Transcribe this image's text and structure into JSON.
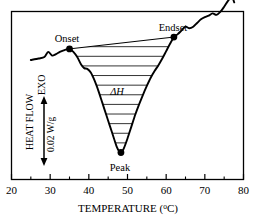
{
  "chart_data": {
    "type": "line",
    "title": "",
    "xlabel": "TEMPERATURE (°C)",
    "ylabel": "HEAT FLOW",
    "y_scale_bar": "0.02 W/g",
    "y_direction_label": "EXO",
    "xlim": [
      20,
      80
    ],
    "grid": false,
    "legend": "none",
    "xticks": [
      20,
      30,
      40,
      50,
      60,
      70,
      80
    ],
    "xtick_labels": [
      "20",
      "30",
      "40",
      "50",
      "60",
      "70",
      "80"
    ],
    "xminor_ticks": [
      25,
      35,
      45,
      55,
      65,
      75
    ],
    "yticks_labeled": false,
    "series": [
      {
        "name": "DSC heat flow trace",
        "x": [
          25.0,
          27.0,
          28.5,
          29.5,
          30.5,
          31.5,
          32.5,
          33.5,
          34.3,
          35.0,
          36.0,
          37.0,
          38.0,
          38.8,
          39.6,
          40.5,
          41.5,
          42.5,
          43.5,
          44.5,
          45.5,
          46.5,
          47.2,
          47.8,
          48.3,
          49.0,
          50.0,
          51.0,
          52.0,
          53.0,
          54.0,
          55.0,
          56.0,
          57.0,
          58.0,
          59.0,
          60.0,
          61.0,
          62.0,
          63.0,
          64.0,
          65.0,
          66.0,
          67.0,
          68.0,
          69.0,
          70.0,
          71.0,
          72.0,
          73.0,
          74.0,
          75.0,
          76.0,
          77.0,
          77.6
        ],
        "y": [
          0.0,
          0.01,
          0.02,
          0.055,
          0.03,
          0.04,
          0.055,
          0.065,
          0.072,
          0.075,
          0.055,
          0.02,
          -0.03,
          -0.055,
          -0.06,
          -0.085,
          -0.14,
          -0.21,
          -0.29,
          -0.37,
          -0.45,
          -0.53,
          -0.585,
          -0.615,
          -0.625,
          -0.6,
          -0.53,
          -0.45,
          -0.37,
          -0.3,
          -0.235,
          -0.175,
          -0.12,
          -0.075,
          -0.035,
          0.01,
          0.06,
          0.11,
          0.155,
          0.175,
          0.2,
          0.225,
          0.215,
          0.225,
          0.25,
          0.275,
          0.29,
          0.3,
          0.315,
          0.305,
          0.325,
          0.36,
          0.4,
          0.425,
          0.39
        ]
      }
    ],
    "markers": [
      {
        "name": "Onset",
        "label": "Onset",
        "x": 35.0,
        "y": 0.075
      },
      {
        "name": "Endset",
        "label": "Endset",
        "x": 62.0,
        "y": 0.155
      },
      {
        "name": "Peak",
        "label": "Peak",
        "x": 48.3,
        "y": -0.625
      }
    ],
    "annotations": [
      {
        "name": "enthalpy",
        "label": "ΔH",
        "x": 47.5,
        "y": -0.185,
        "style": "italic",
        "description": "Hatched area between the onset-endset baseline chord and the endothermic peak"
      }
    ],
    "baseline_chord": {
      "x1": 35.0,
      "y1": 0.075,
      "x2": 62.0,
      "y2": 0.155
    },
    "hatch": {
      "orientation": "horizontal",
      "line_count": 11
    }
  },
  "axis": {
    "x_title": "TEMPERATURE (°C)",
    "x_title_main": "TEMPERATURE (",
    "x_title_sup": "o",
    "x_title_tail": "C)",
    "y_title": "HEAT FLOW",
    "y_exo": "EXO",
    "y_scale": "0.02 W/g"
  },
  "ticks": {
    "x": [
      "20",
      "30",
      "40",
      "50",
      "60",
      "70",
      "80"
    ]
  },
  "labels": {
    "onset": "Onset",
    "endset": "Endset",
    "peak": "Peak",
    "delta_h": "ΔH"
  },
  "colors": {
    "curve": "#000000",
    "frame": "#000000",
    "hatch": "#000000",
    "background": "#ffffff"
  }
}
